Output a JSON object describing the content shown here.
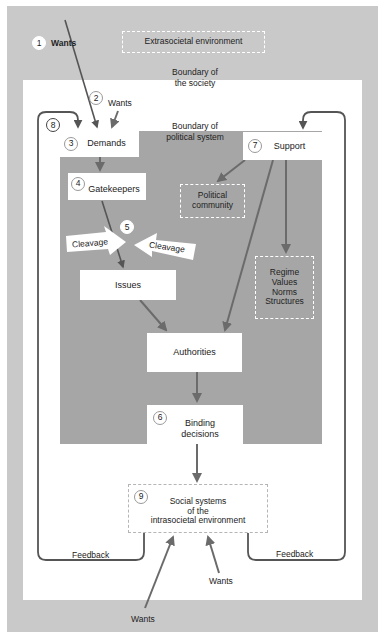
{
  "environment": {
    "extrasocietal_label": "Extrasocietal environment",
    "society_boundary": [
      "Boundary of",
      "the society"
    ],
    "political_boundary": [
      "Boundary of",
      "political system"
    ]
  },
  "nodes": {
    "wants_1": {
      "number": "1",
      "label": "Wants"
    },
    "wants_2": {
      "number": "2",
      "label": "Wants"
    },
    "demands": {
      "number": "3",
      "label": "Demands"
    },
    "gatekeepers": {
      "number": "4",
      "label": "Gatekeepers"
    },
    "cleavage": {
      "number": "5",
      "left_label": "Cleavage",
      "right_label": "Cleavage"
    },
    "issues": {
      "label": "Issues"
    },
    "binding_decisions": {
      "number": "6",
      "label_lines": [
        "Binding",
        "decisions"
      ]
    },
    "support": {
      "number": "7",
      "label": "Support"
    },
    "feedback_loop": {
      "number": "8"
    },
    "political_community": {
      "label_lines": [
        "Political",
        "community"
      ]
    },
    "regime": {
      "label_lines": [
        "Regime",
        "Values",
        "Norms",
        "Structures"
      ]
    },
    "authorities": {
      "label": "Authorities"
    },
    "social_systems": {
      "number": "9",
      "label_lines": [
        "Social systems",
        "of the",
        "intrasocietal environment"
      ]
    }
  },
  "feedback": {
    "left_label": "Feedback",
    "right_label": "Feedback"
  },
  "bottom_wants": {
    "inner_label": "Wants",
    "outer_label": "Wants"
  },
  "colors": {
    "outer_environment": "#c9c9c9",
    "society": "#ffffff",
    "political_system": "#a6a6a6",
    "arrow": "#6b6b6b",
    "feedback_line": "#555555"
  }
}
